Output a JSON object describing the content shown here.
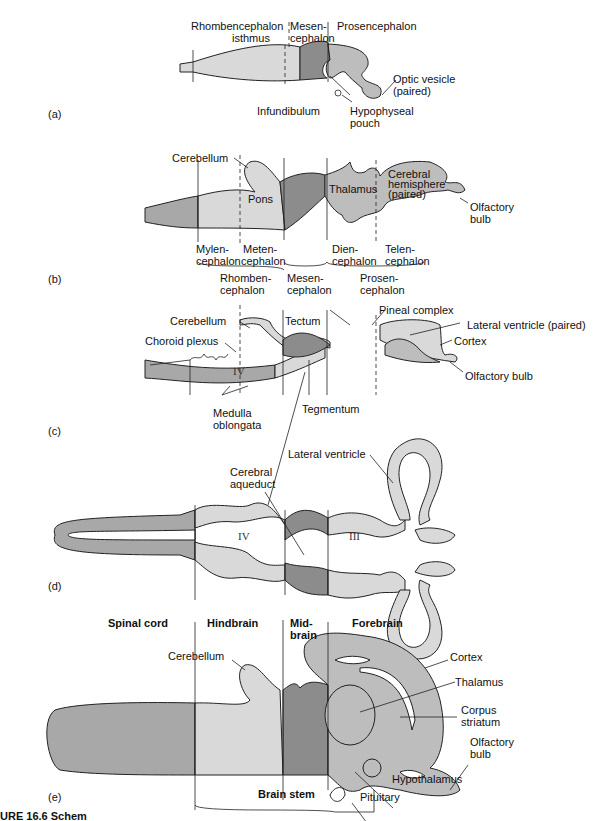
{
  "figure": {
    "caption_fragment": "URE 16.6  Schem",
    "colors": {
      "spinal_cord": "#a8a8a8",
      "rhombencephalon": "#d9d9d9",
      "mesencephalon": "#8c8c8c",
      "prosencephalon": "#bdbdbd",
      "outline": "#222222"
    }
  },
  "panel_a": {
    "tag": "(a)",
    "labels": {
      "rhombencephalon": "Rhombencephalon",
      "isthmus": "isthmus",
      "mesen": "Mesen-",
      "cephalon": "cephalon",
      "prosencephalon": "Prosencephalon",
      "optic_vesicle_1": "Optic vesicle",
      "optic_vesicle_2": "(paired)",
      "infundibulum": "Infundibulum",
      "hypophyseal_1": "Hypophyseal",
      "hypophyseal_2": "pouch"
    }
  },
  "panel_b": {
    "tag": "(b)",
    "labels": {
      "cerebellum": "Cerebellum",
      "pons": "Pons",
      "thalamus": "Thalamus",
      "cerebral_1": "Cerebral",
      "cerebral_2": "hemisphere",
      "cerebral_3": "(paired)",
      "olfactory_1": "Olfactory",
      "olfactory_2": "bulb",
      "mylen_1": "Mylen-",
      "mylen_2": "cephalon",
      "meten_1": "Meten-",
      "meten_2": "cephalon",
      "dien_1": "Dien-",
      "dien_2": "cephalon",
      "telen_1": "Telen-",
      "telen_2": "cephalon",
      "rhomben_1": "Rhomben-",
      "rhomben_2": "cephalon",
      "mesen_1": "Mesen-",
      "mesen_2": "cephalon",
      "prosen_1": "Prosen-",
      "prosen_2": "cephalon"
    }
  },
  "panel_c": {
    "tag": "(c)",
    "labels": {
      "cerebellum": "Cerebellum",
      "choroid": "Choroid plexus",
      "tectum": "Tectum",
      "pineal": "Pineal complex",
      "lateral_ventricle": "Lateral ventricle (paired)",
      "cortex": "Cortex",
      "olfactory": "Olfactory bulb",
      "tegmentum": "Tegmentum",
      "medulla_1": "Medulla",
      "medulla_2": "oblongata",
      "ventricle_iv": "IV"
    }
  },
  "panel_d": {
    "tag": "(d)",
    "labels": {
      "cerebral_aqueduct_1": "Cerebral",
      "cerebral_aqueduct_2": "aqueduct",
      "lateral_ventricle": "Lateral ventricle",
      "ventricle_iv": "IV",
      "ventricle_iii": "III"
    }
  },
  "panel_e": {
    "tag": "(e)",
    "labels": {
      "spinal_cord": "Spinal cord",
      "hindbrain": "Hindbrain",
      "mid_1": "Mid-",
      "mid_2": "brain",
      "forebrain": "Forebrain",
      "cerebellum": "Cerebellum",
      "cortex": "Cortex",
      "thalamus": "Thalamus",
      "corpus_1": "Corpus",
      "corpus_2": "striatum",
      "olfactory_1": "Olfactory",
      "olfactory_2": "bulb",
      "hypothalamus": "Hypothalamus",
      "pituitary": "Pituitary",
      "brain_stem": "Brain stem"
    }
  }
}
